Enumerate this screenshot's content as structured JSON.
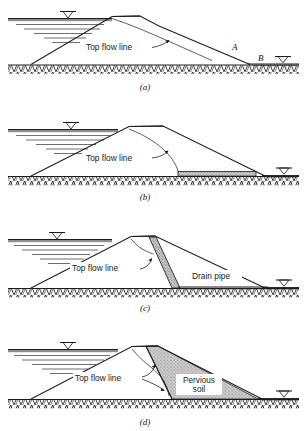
{
  "figure": {
    "background_color": "#ffffff",
    "ink_color": "#1c1c1c",
    "fill_gray": "#b8b8b8",
    "water_line_color": "#555555"
  },
  "panels": [
    {
      "id": "a",
      "caption": "(a)",
      "flow_line_label": "Top flow line",
      "point_labels": [
        "A",
        "B"
      ],
      "description": "Homogeneous dam with no drainage; top flow line exits on downstream slope between A and B",
      "extra_labels": []
    },
    {
      "id": "b",
      "caption": "(b)",
      "flow_line_label": "Top flow line",
      "point_labels": [],
      "description": "Dam with horizontal drainage blanket at downstream toe",
      "extra_labels": []
    },
    {
      "id": "c",
      "caption": "(c)",
      "flow_line_label": "Top flow line",
      "point_labels": [],
      "description": "Dam with inclined chimney drain and drain pipe at toe",
      "extra_labels": [
        "Drain pipe"
      ]
    },
    {
      "id": "d",
      "caption": "(d)",
      "flow_line_label": "Top flow line",
      "point_labels": [],
      "description": "Zoned dam with pervious soil shell on downstream side",
      "extra_labels": [
        "Pervious",
        "soil"
      ]
    }
  ],
  "labels": {
    "top_flow_line": "Top flow line",
    "drain_pipe": "Drain pipe",
    "pervious_line1": "Pervious",
    "pervious_line2": "soil",
    "point_a": "A",
    "point_b": "B",
    "caption_a": "(a)",
    "caption_b": "(b)",
    "caption_c": "(c)",
    "caption_d": "(d)"
  },
  "symbols": {
    "water_table": "water-table-triangle",
    "ground_hatch": "zigzag-ground-hatch",
    "arrow": "leader-arrow"
  }
}
